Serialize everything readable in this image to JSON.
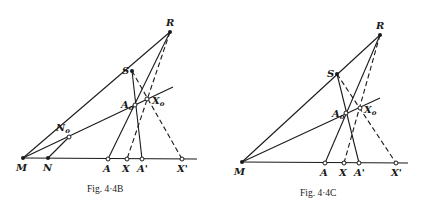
{
  "figures": [
    {
      "caption": "Fig. 4·4B",
      "points": {
        "R": {
          "label": "R"
        },
        "S": {
          "label": "S"
        },
        "M": {
          "label": "M"
        },
        "N": {
          "label": "N"
        },
        "N0": {
          "label": "N",
          "sub": "o"
        },
        "A0": {
          "label": "A",
          "sub": "o"
        },
        "X0": {
          "label": "X",
          "sub": "o"
        },
        "A": {
          "label": "A"
        },
        "X": {
          "label": "X"
        },
        "Ap": {
          "label": "A'"
        },
        "Xp": {
          "label": "X'"
        }
      }
    },
    {
      "caption": "Fig. 4·4C",
      "points": {
        "R": {
          "label": "R"
        },
        "S": {
          "label": "S"
        },
        "M": {
          "label": "M"
        },
        "A0": {
          "label": "A",
          "sub": "o"
        },
        "X0": {
          "label": "X",
          "sub": "o"
        },
        "A": {
          "label": "A"
        },
        "X": {
          "label": "X"
        },
        "Ap": {
          "label": "A'"
        },
        "Xp": {
          "label": "X'"
        }
      }
    }
  ]
}
